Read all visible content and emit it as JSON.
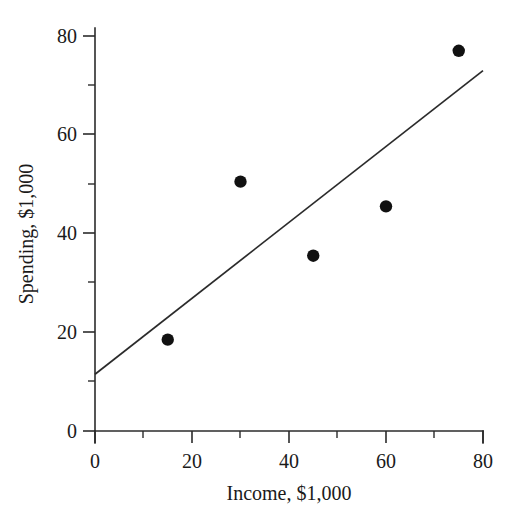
{
  "chart_data": {
    "type": "scatter",
    "title": "",
    "xlabel": "Income, $1,000",
    "ylabel": "Spending, $1,000",
    "xlim": [
      0,
      80
    ],
    "ylim": [
      0,
      80
    ],
    "grid": false,
    "legend": null,
    "x_ticks": [
      0,
      20,
      40,
      60,
      80
    ],
    "y_ticks": [
      0,
      20,
      40,
      60,
      80
    ],
    "x_tick_labels": [
      "0",
      "20",
      "40",
      "60",
      "80"
    ],
    "y_tick_labels": [
      "0",
      "20",
      "40",
      "60",
      "80"
    ],
    "x_minor_ticks": [
      10,
      30,
      50,
      70
    ],
    "y_minor_ticks": [
      10,
      30,
      50,
      70
    ],
    "points": [
      {
        "x": 15,
        "y": 18.5
      },
      {
        "x": 30,
        "y": 50.5
      },
      {
        "x": 45,
        "y": 35.5
      },
      {
        "x": 60,
        "y": 45.5
      },
      {
        "x": 75,
        "y": 77.0
      }
    ],
    "series": [
      {
        "name": "observations",
        "x": [
          15,
          30,
          45,
          60,
          75
        ],
        "y": [
          18.5,
          50.5,
          35.5,
          45.5,
          77.0
        ]
      }
    ],
    "fit_line": {
      "name": "regression line",
      "x_start": 0,
      "y_start": 11.5,
      "x_end": 80,
      "y_end": 73.0,
      "intercept": 11.5,
      "slope": 0.769
    },
    "marker_color": "#111111",
    "line_color": "#2b2b2b",
    "axis_color": "#2b2b2b",
    "background_color": "#ffffff"
  }
}
